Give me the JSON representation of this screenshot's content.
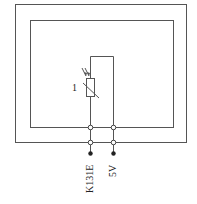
{
  "diagram": {
    "type": "circuit-schematic",
    "component_label": "1",
    "component": "photoresistor",
    "terminals": [
      {
        "label": "K131E",
        "wire": "left"
      },
      {
        "label": "5V",
        "wire": "right"
      }
    ],
    "colors": {
      "line": "#555555",
      "background": "#ffffff"
    }
  }
}
